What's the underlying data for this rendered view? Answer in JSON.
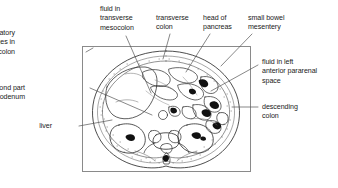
{
  "figure": {
    "type": "labeled-anatomical-cross-section",
    "modality": "CT axial abdomen line drawing",
    "frame": {
      "x": 82,
      "y": 46,
      "width": 169,
      "height": 126,
      "border_color": "#8a8a8a"
    },
    "ink_color": "#1a1a1a",
    "leader_color": "#555555"
  },
  "labels": [
    {
      "id": "inflammatory-changes-in-transverse-colon",
      "lines": [
        "inflammatory",
        "changes in",
        "transverse colon"
      ],
      "align": "right",
      "x": 15,
      "y": 29,
      "leader": [
        [
          93,
          48
        ],
        [
          86,
          52
        ]
      ]
    },
    {
      "id": "fluid-in-transverse-mesocolon",
      "lines": [
        "fluid in",
        "transverse",
        "mesocolon"
      ],
      "align": "left",
      "x": 100,
      "y": 5,
      "leader": [
        [
          126,
          36
        ],
        [
          151,
          93
        ]
      ]
    },
    {
      "id": "transverse-colon",
      "lines": [
        "transverse",
        "colon"
      ],
      "align": "left",
      "x": 156,
      "y": 14,
      "leader": [
        [
          170,
          34
        ],
        [
          163,
          59
        ]
      ]
    },
    {
      "id": "head-of-pancreas",
      "lines": [
        "head of",
        "pancreas"
      ],
      "align": "left",
      "x": 203,
      "y": 14,
      "leader": [
        [
          210,
          34
        ],
        [
          186,
          72
        ]
      ]
    },
    {
      "id": "small-bowel-mesentery",
      "lines": [
        "small bowel",
        "mesentery"
      ],
      "align": "left",
      "x": 248,
      "y": 14,
      "leader": [
        [
          252,
          34
        ],
        [
          221,
          66
        ]
      ]
    },
    {
      "id": "fluid-in-left-anterior-pararenal-space",
      "lines": [
        "fluid in left",
        "anterior pararenal",
        "space"
      ],
      "align": "left",
      "x": 262,
      "y": 58,
      "leader": [
        [
          258,
          65
        ],
        [
          211,
          91
        ]
      ]
    },
    {
      "id": "descending-colon",
      "lines": [
        "descending",
        "colon"
      ],
      "align": "left",
      "x": 262,
      "y": 103,
      "leader": [
        [
          258,
          107
        ],
        [
          232,
          107
        ]
      ]
    },
    {
      "id": "second-part-duodenum",
      "lines": [
        "second part",
        "duodenum"
      ],
      "align": "right",
      "x": 25,
      "y": 84,
      "leader": [
        [
          90,
          88
        ],
        [
          152,
          115
        ]
      ]
    },
    {
      "id": "liver",
      "lines": [
        "liver"
      ],
      "align": "right",
      "x": 52,
      "y": 122,
      "leader": [
        [
          79,
          126
        ],
        [
          112,
          120
        ]
      ]
    }
  ]
}
